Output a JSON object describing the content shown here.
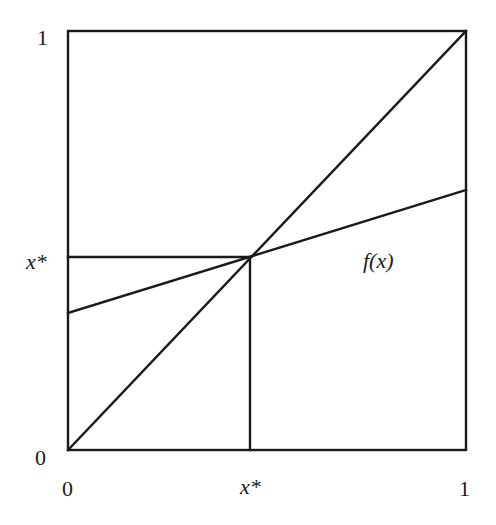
{
  "diagram": {
    "type": "fixed-point-diagram",
    "axes": {
      "x_ticks": [
        {
          "label": "0",
          "value": 0
        },
        {
          "label": "x*",
          "value": 0.457
        },
        {
          "label": "1",
          "value": 1
        }
      ],
      "y_ticks": [
        {
          "label": "0",
          "value": 0
        },
        {
          "label": "x*",
          "value": 0.457
        },
        {
          "label": "1",
          "value": 1
        }
      ],
      "range": {
        "x": [
          0,
          1
        ],
        "y": [
          0,
          1
        ]
      }
    },
    "curves": [
      {
        "name": "45-degree line",
        "from": [
          0,
          0
        ],
        "to": [
          1,
          1
        ]
      },
      {
        "name": "f(x)",
        "label": "f(x)",
        "from": [
          0,
          0.327
        ],
        "to": [
          1,
          0.621
        ]
      }
    ],
    "guides": [
      {
        "name": "horizontal guide at x*",
        "from": [
          0,
          0.457
        ],
        "to": [
          0.457,
          0.457
        ]
      },
      {
        "name": "vertical guide at x*",
        "from": [
          0.457,
          0
        ],
        "to": [
          0.457,
          0.457
        ]
      }
    ],
    "fixed_point": {
      "x": 0.457,
      "y": 0.457,
      "label": "x*"
    },
    "labels": {
      "y_top": "1",
      "y_fixed": "x*",
      "y_origin": "0",
      "x_origin": "0",
      "x_fixed": "x*",
      "x_right": "1",
      "curve": "f(x)"
    },
    "colors": {
      "ink": "#1a1a1a",
      "background": "#ffffff"
    }
  }
}
